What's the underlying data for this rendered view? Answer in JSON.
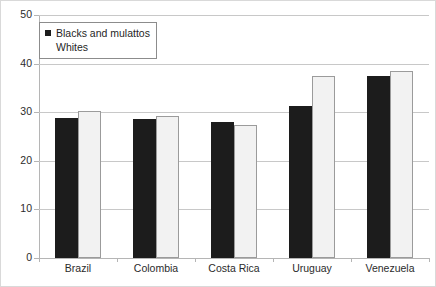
{
  "chart_data": {
    "type": "bar",
    "title": "",
    "subtitle": "",
    "xlabel": "",
    "ylabel": "",
    "categories": [
      "Brazil",
      "Colombia",
      "Costa Rica",
      "Uruguay",
      "Venezuela"
    ],
    "series": [
      {
        "name": "Blacks and mulattos",
        "color": "#1c1c1c",
        "values": [
          28.8,
          28.6,
          28.0,
          31.2,
          37.5
        ]
      },
      {
        "name": "Whites",
        "color": "#f2f2f2",
        "values": [
          30.3,
          29.3,
          27.3,
          37.5,
          38.5
        ]
      }
    ],
    "ylim": [
      0,
      50
    ],
    "yticks": [
      0,
      10,
      20,
      30,
      40,
      50
    ],
    "ytick_labels": [
      "0",
      "10",
      "20",
      "30",
      "40",
      "50"
    ],
    "grid": "horizontal",
    "legend_position": "top-left-inside"
  },
  "legend": {
    "entries": [
      {
        "label": "Blacks and mulattos",
        "marker": "filled-square-marker"
      },
      {
        "label": "Whites",
        "marker": "white-square-marker"
      }
    ]
  },
  "colors": {
    "series_dark": "#1c1c1c",
    "series_light": "#f2f2f2",
    "series_light_border": "#9b9b9b",
    "gridline": "#c8c8c8",
    "axis": "#b5b5b5",
    "frame": "#d9d9d9",
    "text": "#2b2b2b",
    "background": "#ffffff"
  }
}
